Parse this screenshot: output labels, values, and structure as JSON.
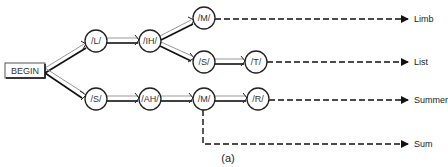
{
  "diagram": {
    "start": {
      "label": "BEGIN",
      "x": 5,
      "y": 63,
      "w": 40,
      "h": 15
    },
    "nodes": [
      {
        "id": "L",
        "label": "/L/",
        "cx": 96,
        "cy": 41
      },
      {
        "id": "IH",
        "label": "/IH/",
        "cx": 150,
        "cy": 41
      },
      {
        "id": "M1",
        "label": "/M/",
        "cx": 204,
        "cy": 18
      },
      {
        "id": "S1",
        "label": "/S/",
        "cx": 204,
        "cy": 62
      },
      {
        "id": "T",
        "label": "/T/",
        "cx": 256,
        "cy": 62
      },
      {
        "id": "S2",
        "label": "/S/",
        "cx": 96,
        "cy": 99
      },
      {
        "id": "AH",
        "label": "/AH/",
        "cx": 150,
        "cy": 99
      },
      {
        "id": "M2",
        "label": "/M/",
        "cx": 204,
        "cy": 99
      },
      {
        "id": "R",
        "label": "/R/",
        "cx": 258,
        "cy": 99
      }
    ],
    "words": [
      {
        "label": "Limb",
        "x": 414,
        "y": 22
      },
      {
        "label": "List",
        "x": 414,
        "y": 65
      },
      {
        "label": "Summer",
        "x": 414,
        "y": 103
      },
      {
        "label": "Sum",
        "x": 414,
        "y": 148
      }
    ],
    "caption": "(a)"
  }
}
